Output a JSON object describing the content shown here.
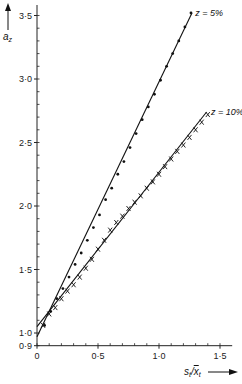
{
  "chart_data": {
    "type": "scatter",
    "title": "",
    "xlabel": "s_t / x̄_t",
    "ylabel": "a_z",
    "xlim": [
      0,
      1.6
    ],
    "ylim": [
      0.9,
      3.55
    ],
    "grid": false,
    "x_ticks": [
      {
        "v": 0,
        "label": "0"
      },
      {
        "v": 0.5,
        "label": "0·5"
      },
      {
        "v": 1.0,
        "label": "1·0"
      },
      {
        "v": 1.5,
        "label": "1·5"
      }
    ],
    "y_ticks": [
      {
        "v": 0.9,
        "label": "0·9"
      },
      {
        "v": 1.0,
        "label": "1·0"
      },
      {
        "v": 1.5,
        "label": "1·5"
      },
      {
        "v": 2.0,
        "label": "2·0"
      },
      {
        "v": 2.5,
        "label": "2·5"
      },
      {
        "v": 3.0,
        "label": "3·0"
      },
      {
        "v": 3.5,
        "label": "3·5"
      }
    ],
    "series": [
      {
        "name": "z = 5%",
        "marker": "dot",
        "fit_line": {
          "x0": 0,
          "y0": 0.97,
          "x1": 1.27,
          "y1": 3.52
        },
        "x": [
          0.05,
          0.1,
          0.15,
          0.2,
          0.25,
          0.3,
          0.35,
          0.4,
          0.45,
          0.5,
          0.55,
          0.6,
          0.65,
          0.7,
          0.75,
          0.8,
          0.85,
          0.9,
          0.95,
          1.0,
          1.05,
          1.1,
          1.15,
          1.2,
          1.25
        ],
        "y": [
          1.06,
          1.17,
          1.27,
          1.35,
          1.44,
          1.54,
          1.63,
          1.73,
          1.83,
          1.93,
          2.05,
          2.14,
          2.25,
          2.35,
          2.46,
          2.57,
          2.68,
          2.78,
          2.88,
          2.99,
          3.1,
          3.2,
          3.3,
          3.41,
          3.52
        ]
      },
      {
        "name": "z = 10%",
        "marker": "cross",
        "fit_line": {
          "x0": 0,
          "y0": 1.05,
          "x1": 1.39,
          "y1": 2.74
        },
        "x": [
          0.05,
          0.1,
          0.15,
          0.2,
          0.25,
          0.3,
          0.35,
          0.4,
          0.45,
          0.5,
          0.55,
          0.6,
          0.65,
          0.7,
          0.75,
          0.8,
          0.85,
          0.9,
          0.95,
          1.0,
          1.05,
          1.1,
          1.15,
          1.2,
          1.25,
          1.3,
          1.35,
          1.4
        ],
        "y": [
          1.06,
          1.15,
          1.2,
          1.27,
          1.33,
          1.38,
          1.44,
          1.51,
          1.58,
          1.66,
          1.73,
          1.81,
          1.87,
          1.92,
          1.98,
          2.03,
          2.08,
          2.14,
          2.19,
          2.25,
          2.31,
          2.37,
          2.43,
          2.48,
          2.54,
          2.6,
          2.66,
          2.72
        ]
      }
    ],
    "annotations": [
      {
        "text": "z = 5%",
        "x": 1.28,
        "y": 3.52
      },
      {
        "text": "z = 10%",
        "x": 1.41,
        "y": 2.74
      }
    ]
  },
  "labels": {
    "y_axis": "a",
    "y_axis_sub": "z",
    "x_axis_s": "s",
    "x_axis_sub1": "t",
    "x_axis_x": "x",
    "x_axis_sub2": "t"
  }
}
